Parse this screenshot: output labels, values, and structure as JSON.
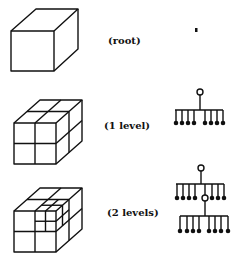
{
  "figure": {
    "rows": [
      {
        "id": "root",
        "label": "(root)",
        "subdivision_levels": 0,
        "tree_leaves_per_node": 0
      },
      {
        "id": "level1",
        "label": "(1 level)",
        "subdivision_levels": 1,
        "tree_leaves_per_node": 8
      },
      {
        "id": "level2",
        "label": "(2 levels)",
        "subdivision_levels": 2,
        "tree_leaves_per_node": 8,
        "expanded_child_index": 4
      }
    ],
    "colors": {
      "ink": "#111111",
      "background": "#ffffff"
    }
  }
}
